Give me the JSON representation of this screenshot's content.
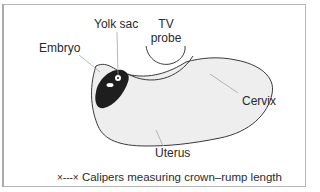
{
  "diagram": {
    "type": "anatomical",
    "labels": {
      "yolk_sac": "Yolk sac",
      "tv_probe_line1": "TV",
      "tv_probe_line2": "probe",
      "embryo": "Embryo",
      "cervix": "Cervix",
      "uterus": "Uterus"
    },
    "legend": {
      "symbol": "×---×",
      "text": "Calipers measuring crown–rump length"
    },
    "colors": {
      "outline": "#3a3a3a",
      "leader_line": "#9a9a9a",
      "uterus_fill": "#eeeeee",
      "embryo_fill": "#1e1e1e",
      "frame": "#b5b5b5"
    }
  }
}
